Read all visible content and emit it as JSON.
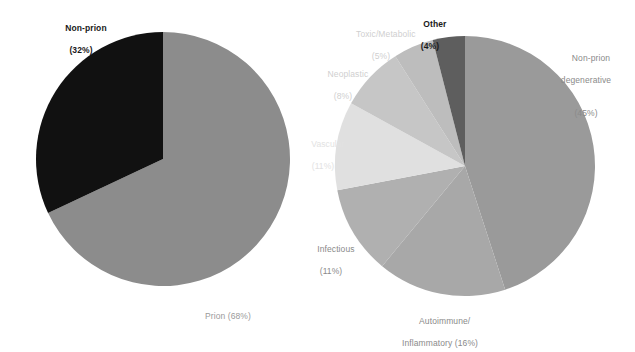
{
  "figure": {
    "background": "#ffffff",
    "width": 635,
    "height": 347
  },
  "chart_data": [
    {
      "type": "pie",
      "id": "left-pie",
      "title": "",
      "categories": [
        "Non-prion",
        "Prion"
      ],
      "values": [
        32,
        68
      ],
      "unit": "%",
      "labels": [
        "Non-prion\n(32%)",
        "Prion (68%)"
      ],
      "colors": [
        "#111111",
        "#8c8c8c"
      ],
      "legend": "none",
      "center": [
        163,
        159
      ],
      "radius": 127,
      "start_angle_deg": 0,
      "direction": "counterclockwise"
    },
    {
      "type": "pie",
      "id": "right-pie",
      "title": "",
      "categories": [
        "Non-prion degenerative",
        "Autoimmune/Inflammatory",
        "Infectious",
        "Vascular",
        "Neoplastic",
        "Toxic/Metabolic",
        "Other"
      ],
      "values": [
        45,
        16,
        11,
        11,
        8,
        5,
        4
      ],
      "unit": "%",
      "labels": [
        "Non-prion\ndegenerative\n(45%)",
        "Autoimmune/\nInflammatory (16%)",
        "Infectious\n(11%)",
        "Vascular\n(11%)",
        "Neoplastic\n(8%)",
        "Toxic/Metabolic\n(5%)",
        "Other\n(4%)"
      ],
      "colors": [
        "#9a9a9a",
        "#a8a8a8",
        "#b0b0b0",
        "#e0e0e0",
        "#c6c6c6",
        "#bdbdbd",
        "#5e5e5e"
      ],
      "legend": "none",
      "center": [
        465,
        166
      ],
      "radius": 130,
      "start_angle_deg": 0,
      "direction": "clockwise"
    }
  ],
  "left_chart": {
    "slices": [
      {
        "name": "Non-prion",
        "percent": "32",
        "line1": "Non-prion",
        "line2": "(32%)",
        "color": "#111111"
      },
      {
        "name": "Prion",
        "percent": "68",
        "line1": "Prion (68%)",
        "line2": "",
        "color": "#8c8c8c"
      }
    ]
  },
  "right_chart": {
    "slices": [
      {
        "name": "Non-prion degenerative",
        "percent": "45",
        "line1": "Non-prion",
        "line2": "degenerative",
        "line3": "(45%)",
        "color": "#9a9a9a"
      },
      {
        "name": "Autoimmune/Inflammatory",
        "percent": "16",
        "line1": "Autoimmune/",
        "line2": "Inflammatory (16%)",
        "color": "#a8a8a8"
      },
      {
        "name": "Infectious",
        "percent": "11",
        "line1": "Infectious",
        "line2": "(11%)",
        "color": "#b0b0b0"
      },
      {
        "name": "Vascular",
        "percent": "11",
        "line1": "Vascular",
        "line2": "(11%)",
        "color": "#e0e0e0"
      },
      {
        "name": "Neoplastic",
        "percent": "8",
        "line1": "Neoplastic",
        "line2": "(8%)",
        "color": "#c6c6c6"
      },
      {
        "name": "Toxic/Metabolic",
        "percent": "5",
        "line1": "Toxic/Metabolic",
        "line2": "(5%)",
        "color": "#bdbdbd"
      },
      {
        "name": "Other",
        "percent": "4",
        "line1": "Other",
        "line2": "(4%)",
        "color": "#5e5e5e"
      }
    ]
  }
}
